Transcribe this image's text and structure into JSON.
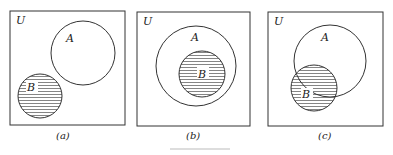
{
  "diagrams": [
    {
      "id": "a",
      "universe_label": "U",
      "set_a_label": "A",
      "set_b_label": "B",
      "caption": "(a)",
      "relation": "disjoint"
    },
    {
      "id": "b",
      "universe_label": "U",
      "set_a_label": "A",
      "set_b_label": "B",
      "caption": "(b)",
      "relation": "B subset of A"
    },
    {
      "id": "c",
      "universe_label": "U",
      "set_a_label": "A",
      "set_b_label": "B",
      "caption": "(c)",
      "relation": "overlapping"
    }
  ],
  "colors": {
    "stroke": "#333333",
    "hatch": "#555555",
    "background": "#ffffff"
  }
}
